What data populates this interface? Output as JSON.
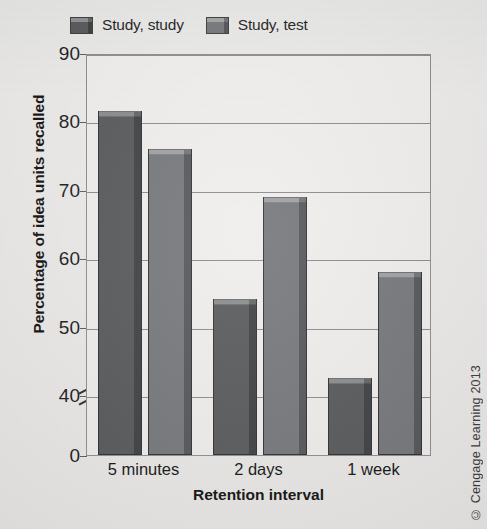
{
  "chart_data": {
    "type": "bar",
    "title": "",
    "categories": [
      "5 minutes",
      "2 days",
      "1 week"
    ],
    "series": [
      {
        "name": "Study, study",
        "values": [
          81.5,
          54,
          42.5
        ],
        "color": "#57585a"
      },
      {
        "name": "Study, test",
        "values": [
          76,
          69,
          58
        ],
        "color": "#74767a"
      }
    ],
    "xlabel": "Retention interval",
    "ylabel": "Percentage of idea units recalled",
    "ylim": [
      0,
      90
    ],
    "y_axis_break": true,
    "y_break_between": [
      0,
      40
    ],
    "yticks": [
      "0",
      "40",
      "50",
      "60",
      "70",
      "80",
      "90"
    ],
    "ytick_values": [
      0,
      40,
      50,
      60,
      70,
      80,
      90
    ],
    "grid": true,
    "grid_axis": "y",
    "legend_position": "top"
  },
  "legend": {
    "entries": [
      {
        "label": "Study, study"
      },
      {
        "label": "Study, test"
      }
    ]
  },
  "axes": {
    "y_title": "Percentage of idea units recalled",
    "x_title": "Retention interval"
  },
  "footer": {
    "copyright": "© Cengage Learning 2013"
  }
}
